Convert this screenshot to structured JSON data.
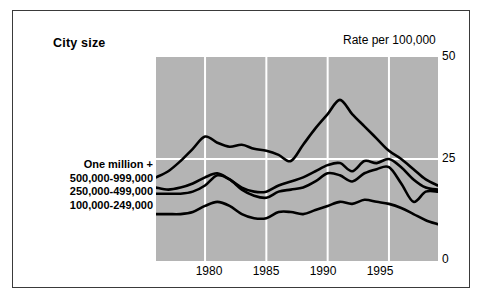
{
  "figure": {
    "title_left": "City size",
    "title_right": "Rate per 100,000"
  },
  "legend": {
    "items": [
      {
        "label": "One million +"
      },
      {
        "label": "500,000-999,000"
      },
      {
        "label": "250,000-499,000"
      },
      {
        "label": "100,000-249,000"
      }
    ]
  },
  "axes": {
    "y_ticks": [
      "50",
      "25",
      "0"
    ],
    "x_ticks": [
      "1980",
      "1985",
      "1990",
      "1995"
    ]
  },
  "chart_data": {
    "type": "line",
    "title": "City size",
    "xlabel": "",
    "ylabel": "Rate per 100,000",
    "xlim": [
      1976,
      1999
    ],
    "ylim": [
      0,
      50
    ],
    "yticks": [
      0,
      25,
      50
    ],
    "xticks": [
      1980,
      1985,
      1990,
      1995
    ],
    "grid": true,
    "grid_color": "#ffffff",
    "plot_background": "#b4b4b4",
    "line_color": "#000000",
    "legend_position": "left-outside",
    "x": [
      1976,
      1977,
      1978,
      1979,
      1980,
      1981,
      1982,
      1983,
      1984,
      1985,
      1986,
      1987,
      1988,
      1989,
      1990,
      1991,
      1992,
      1993,
      1994,
      1995,
      1996,
      1997,
      1998,
      1999
    ],
    "series": [
      {
        "name": "One million +",
        "values": [
          20.5,
          22.0,
          24.5,
          27.5,
          30.5,
          29.0,
          28.0,
          28.5,
          27.5,
          27.0,
          26.0,
          24.5,
          28.5,
          32.5,
          36.0,
          39.5,
          36.0,
          33.0,
          30.0,
          27.0,
          25.0,
          22.5,
          20.0,
          18.5
        ]
      },
      {
        "name": "500,000-999,000",
        "values": [
          18.0,
          17.5,
          18.0,
          19.0,
          20.5,
          21.5,
          20.0,
          18.0,
          17.0,
          17.0,
          18.5,
          19.5,
          20.5,
          22.0,
          23.5,
          24.0,
          22.0,
          24.5,
          24.0,
          25.0,
          23.0,
          20.0,
          18.0,
          17.5
        ]
      },
      {
        "name": "250,000-499,000",
        "values": [
          16.5,
          16.5,
          16.5,
          17.0,
          18.5,
          21.0,
          20.0,
          17.5,
          16.0,
          15.5,
          17.0,
          17.5,
          18.0,
          19.5,
          21.5,
          21.0,
          19.5,
          21.5,
          22.5,
          23.0,
          19.0,
          14.5,
          17.0,
          17.0
        ]
      },
      {
        "name": "100,000-249,000",
        "values": [
          11.5,
          11.5,
          11.5,
          12.0,
          13.5,
          14.5,
          13.5,
          11.5,
          10.5,
          10.5,
          12.0,
          12.0,
          11.5,
          12.5,
          13.5,
          14.5,
          14.0,
          15.0,
          14.5,
          14.0,
          13.0,
          11.5,
          10.0,
          9.0
        ]
      }
    ]
  }
}
